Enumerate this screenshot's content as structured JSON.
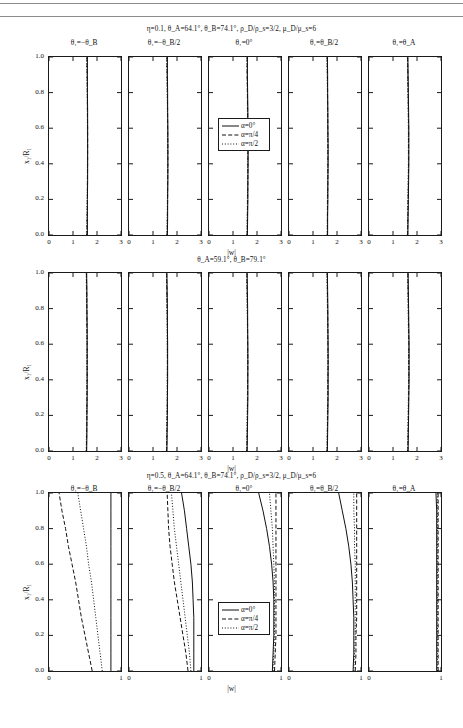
{
  "figure": {
    "xlabel": "|w|",
    "ylabel": "x₁/R₁",
    "legend": {
      "items": [
        {
          "label": "α=0°",
          "style": "solid"
        },
        {
          "label": "α=π/4",
          "style": "dashed"
        },
        {
          "label": "α=π/2",
          "style": "dotted"
        }
      ]
    },
    "column_headers": [
      "θ₁=−θ_B",
      "θ₁=−θ_B/2",
      "θ₁=0°",
      "θ₁=θ_B/2",
      "θ₁=θ_A"
    ],
    "blocks": [
      {
        "title": "η=0.1, θ_A=64.1°, θ_B=74.1°, ρ_D/ρ_s=3/2, μ_D/μ_s=6",
        "xlim": [
          0,
          3
        ],
        "xticks": [
          "0",
          "1",
          "2",
          "3"
        ],
        "ylim": [
          0,
          1
        ],
        "yticks": [
          "0.0",
          "0.2",
          "0.4",
          "0.6",
          "0.8",
          "1.0"
        ],
        "has_legend": true
      },
      {
        "title": "θ_A=59.1°,  θ_B=79.1°",
        "xlim": [
          0,
          3
        ],
        "xticks": [
          "0",
          "1",
          "2",
          "3"
        ],
        "ylim": [
          0,
          1
        ],
        "yticks": [
          "0.0",
          "0.2",
          "0.4",
          "0.6",
          "0.8",
          "1.0"
        ],
        "has_legend": false
      },
      {
        "title": "η=0.5, θ_A=64.1°, θ_B=74.1°, ρ_D/ρ_s=3/2, μ_D/μ_s=6",
        "xlim": [
          0,
          1
        ],
        "xticks": [
          "0",
          "1"
        ],
        "ylim": [
          0,
          1
        ],
        "yticks": [
          "0.0",
          "0.2",
          "0.4",
          "0.6",
          "0.8",
          "1.0"
        ],
        "has_legend": true
      }
    ]
  },
  "chart_data": {
    "type": "line",
    "xlabel": "|w|",
    "ylabel": "x₁/R₁",
    "y": [
      0.0,
      0.1,
      0.2,
      0.3,
      0.4,
      0.5,
      0.6,
      0.7,
      0.8,
      0.9,
      1.0
    ],
    "grid": false,
    "legend_position": "center-panel-middle",
    "panels": [
      {
        "block": 0,
        "block_title": "η=0.1, θ_A=64.1°, θ_B=74.1°, ρ_D/ρ_s=3/2, μ_D/μ_s=6",
        "column": "θ₁=−θ_B",
        "xlim": [
          0,
          3
        ],
        "series": [
          {
            "name": "α=0°",
            "style": "solid",
            "values": [
              1.6,
              1.6,
              1.6,
              1.61,
              1.61,
              1.61,
              1.61,
              1.61,
              1.6,
              1.6,
              1.6
            ]
          },
          {
            "name": "α=π/4",
            "style": "dashed",
            "values": [
              1.58,
              1.59,
              1.6,
              1.6,
              1.61,
              1.61,
              1.61,
              1.6,
              1.6,
              1.59,
              1.58
            ]
          },
          {
            "name": "α=π/2",
            "style": "dotted",
            "values": [
              1.57,
              1.58,
              1.59,
              1.6,
              1.6,
              1.61,
              1.6,
              1.6,
              1.59,
              1.58,
              1.57
            ]
          }
        ]
      },
      {
        "block": 0,
        "column": "θ₁=−θ_B/2",
        "xlim": [
          0,
          3
        ],
        "series": [
          {
            "name": "α=0°",
            "style": "solid",
            "values": [
              1.6,
              1.61,
              1.61,
              1.62,
              1.62,
              1.62,
              1.62,
              1.61,
              1.61,
              1.6,
              1.6
            ]
          },
          {
            "name": "α=π/4",
            "style": "dashed",
            "values": [
              1.59,
              1.6,
              1.61,
              1.61,
              1.62,
              1.62,
              1.61,
              1.61,
              1.6,
              1.59,
              1.58
            ]
          },
          {
            "name": "α=π/2",
            "style": "dotted",
            "values": [
              1.58,
              1.59,
              1.6,
              1.61,
              1.61,
              1.61,
              1.61,
              1.6,
              1.59,
              1.58,
              1.57
            ]
          }
        ]
      },
      {
        "block": 0,
        "column": "θ₁=0°",
        "xlim": [
          0,
          3
        ],
        "series": [
          {
            "name": "α=0°",
            "style": "solid",
            "values": [
              1.6,
              1.61,
              1.62,
              1.62,
              1.63,
              1.63,
              1.62,
              1.62,
              1.61,
              1.6,
              1.6
            ]
          },
          {
            "name": "α=π/4",
            "style": "dashed",
            "values": [
              1.59,
              1.6,
              1.61,
              1.62,
              1.62,
              1.62,
              1.62,
              1.61,
              1.6,
              1.59,
              1.59
            ]
          },
          {
            "name": "α=π/2",
            "style": "dotted",
            "values": [
              1.58,
              1.59,
              1.6,
              1.61,
              1.61,
              1.62,
              1.61,
              1.6,
              1.6,
              1.59,
              1.58
            ]
          }
        ]
      },
      {
        "block": 0,
        "column": "θ₁=θ_B/2",
        "xlim": [
          0,
          3
        ],
        "series": [
          {
            "name": "α=0°",
            "style": "solid",
            "values": [
              1.61,
              1.61,
              1.62,
              1.62,
              1.63,
              1.63,
              1.62,
              1.62,
              1.61,
              1.61,
              1.6
            ]
          },
          {
            "name": "α=π/4",
            "style": "dashed",
            "values": [
              1.6,
              1.6,
              1.61,
              1.62,
              1.62,
              1.62,
              1.62,
              1.61,
              1.61,
              1.6,
              1.59
            ]
          },
          {
            "name": "α=π/2",
            "style": "dotted",
            "values": [
              1.59,
              1.6,
              1.6,
              1.61,
              1.62,
              1.62,
              1.61,
              1.61,
              1.6,
              1.59,
              1.58
            ]
          }
        ]
      },
      {
        "block": 0,
        "column": "θ₁=θ_A",
        "xlim": [
          0,
          3
        ],
        "series": [
          {
            "name": "α=0°",
            "style": "solid",
            "values": [
              1.62,
              1.63,
              1.64,
              1.65,
              1.66,
              1.66,
              1.66,
              1.65,
              1.64,
              1.63,
              1.62
            ]
          },
          {
            "name": "α=π/4",
            "style": "dashed",
            "values": [
              1.61,
              1.62,
              1.63,
              1.64,
              1.65,
              1.65,
              1.65,
              1.64,
              1.63,
              1.62,
              1.61
            ]
          },
          {
            "name": "α=π/2",
            "style": "dotted",
            "values": [
              1.6,
              1.61,
              1.62,
              1.63,
              1.64,
              1.64,
              1.64,
              1.63,
              1.62,
              1.61,
              1.6
            ]
          }
        ]
      },
      {
        "block": 1,
        "block_title": "θ_A=59.1°,  θ_B=79.1°",
        "column": "θ₁=−θ_B",
        "xlim": [
          0,
          3
        ],
        "series": [
          {
            "name": "α=0°",
            "style": "solid",
            "values": [
              1.57,
              1.58,
              1.58,
              1.59,
              1.59,
              1.59,
              1.59,
              1.59,
              1.58,
              1.58,
              1.57
            ]
          },
          {
            "name": "α=π/4",
            "style": "dashed",
            "values": [
              1.56,
              1.57,
              1.58,
              1.58,
              1.59,
              1.59,
              1.59,
              1.58,
              1.58,
              1.57,
              1.56
            ]
          },
          {
            "name": "α=π/2",
            "style": "dotted",
            "values": [
              1.55,
              1.56,
              1.57,
              1.58,
              1.58,
              1.58,
              1.58,
              1.58,
              1.57,
              1.56,
              1.55
            ]
          }
        ]
      },
      {
        "block": 1,
        "column": "θ₁=−θ_B/2",
        "xlim": [
          0,
          3
        ],
        "series": [
          {
            "name": "α=0°",
            "style": "solid",
            "values": [
              1.58,
              1.59,
              1.6,
              1.6,
              1.61,
              1.61,
              1.61,
              1.6,
              1.6,
              1.59,
              1.58
            ]
          },
          {
            "name": "α=π/4",
            "style": "dashed",
            "values": [
              1.57,
              1.58,
              1.59,
              1.6,
              1.6,
              1.6,
              1.6,
              1.6,
              1.59,
              1.58,
              1.57
            ]
          },
          {
            "name": "α=π/2",
            "style": "dotted",
            "values": [
              1.56,
              1.57,
              1.58,
              1.59,
              1.59,
              1.6,
              1.59,
              1.59,
              1.58,
              1.57,
              1.56
            ]
          }
        ]
      },
      {
        "block": 1,
        "column": "θ₁=0°",
        "xlim": [
          0,
          3
        ],
        "series": [
          {
            "name": "α=0°",
            "style": "solid",
            "values": [
              1.59,
              1.6,
              1.61,
              1.62,
              1.62,
              1.62,
              1.62,
              1.61,
              1.61,
              1.6,
              1.59
            ]
          },
          {
            "name": "α=π/4",
            "style": "dashed",
            "values": [
              1.58,
              1.59,
              1.6,
              1.61,
              1.61,
              1.62,
              1.61,
              1.61,
              1.6,
              1.59,
              1.58
            ]
          },
          {
            "name": "α=π/2",
            "style": "dotted",
            "values": [
              1.57,
              1.58,
              1.59,
              1.6,
              1.61,
              1.61,
              1.61,
              1.6,
              1.59,
              1.58,
              1.57
            ]
          }
        ]
      },
      {
        "block": 1,
        "column": "θ₁=θ_B/2",
        "xlim": [
          0,
          3
        ],
        "series": [
          {
            "name": "α=0°",
            "style": "solid",
            "values": [
              1.6,
              1.61,
              1.62,
              1.63,
              1.63,
              1.63,
              1.63,
              1.62,
              1.62,
              1.61,
              1.6
            ]
          },
          {
            "name": "α=π/4",
            "style": "dashed",
            "values": [
              1.59,
              1.6,
              1.61,
              1.62,
              1.62,
              1.63,
              1.62,
              1.62,
              1.61,
              1.6,
              1.59
            ]
          },
          {
            "name": "α=π/2",
            "style": "dotted",
            "values": [
              1.58,
              1.59,
              1.6,
              1.61,
              1.62,
              1.62,
              1.62,
              1.61,
              1.6,
              1.59,
              1.58
            ]
          }
        ]
      },
      {
        "block": 1,
        "column": "θ₁=θ_A",
        "xlim": [
          0,
          3
        ],
        "series": [
          {
            "name": "α=0°",
            "style": "solid",
            "values": [
              1.63,
              1.64,
              1.65,
              1.66,
              1.67,
              1.67,
              1.67,
              1.66,
              1.65,
              1.64,
              1.63
            ]
          },
          {
            "name": "α=π/4",
            "style": "dashed",
            "values": [
              1.62,
              1.63,
              1.64,
              1.65,
              1.66,
              1.66,
              1.66,
              1.65,
              1.64,
              1.63,
              1.62
            ]
          },
          {
            "name": "α=π/2",
            "style": "dotted",
            "values": [
              1.61,
              1.62,
              1.63,
              1.64,
              1.65,
              1.65,
              1.65,
              1.64,
              1.63,
              1.62,
              1.61
            ]
          }
        ]
      },
      {
        "block": 2,
        "block_title": "η=0.5, θ_A=64.1°, θ_B=74.1°, ρ_D/ρ_s=3/2, μ_D/μ_s=6",
        "column": "θ₁=−θ_B",
        "xlim": [
          0,
          1
        ],
        "series": [
          {
            "name": "α=0°",
            "style": "solid",
            "values": [
              0.86,
              0.86,
              0.86,
              0.86,
              0.86,
              0.86,
              0.86,
              0.86,
              0.86,
              0.86,
              0.86
            ]
          },
          {
            "name": "α=π/4",
            "style": "dashed",
            "values": [
              0.6,
              0.55,
              0.5,
              0.45,
              0.41,
              0.37,
              0.32,
              0.27,
              0.23,
              0.18,
              0.14
            ]
          },
          {
            "name": "α=π/2",
            "style": "dotted",
            "values": [
              0.74,
              0.71,
              0.68,
              0.65,
              0.62,
              0.59,
              0.55,
              0.52,
              0.48,
              0.44,
              0.4
            ]
          }
        ]
      },
      {
        "block": 2,
        "column": "θ₁=−θ_B/2",
        "xlim": [
          0,
          1
        ],
        "series": [
          {
            "name": "α=0°",
            "style": "solid",
            "values": [
              0.9,
              0.9,
              0.9,
              0.9,
              0.89,
              0.88,
              0.86,
              0.83,
              0.8,
              0.77,
              0.73
            ]
          },
          {
            "name": "α=π/4",
            "style": "dashed",
            "values": [
              0.82,
              0.79,
              0.75,
              0.71,
              0.67,
              0.63,
              0.6,
              0.57,
              0.55,
              0.54,
              0.53
            ]
          },
          {
            "name": "α=π/2",
            "style": "dotted",
            "values": [
              0.86,
              0.84,
              0.81,
              0.78,
              0.75,
              0.72,
              0.69,
              0.66,
              0.63,
              0.61,
              0.59
            ]
          }
        ]
      },
      {
        "block": 2,
        "column": "θ₁=0°",
        "xlim": [
          0,
          1
        ],
        "series": [
          {
            "name": "α=0°",
            "style": "solid",
            "values": [
              0.88,
              0.89,
              0.9,
              0.9,
              0.9,
              0.89,
              0.87,
              0.84,
              0.8,
              0.75,
              0.69
            ]
          },
          {
            "name": "α=π/4",
            "style": "dashed",
            "values": [
              0.91,
              0.92,
              0.93,
              0.93,
              0.93,
              0.93,
              0.93,
              0.93,
              0.93,
              0.93,
              0.93
            ]
          },
          {
            "name": "α=π/2",
            "style": "dotted",
            "values": [
              0.89,
              0.9,
              0.91,
              0.91,
              0.91,
              0.91,
              0.9,
              0.89,
              0.88,
              0.86,
              0.84
            ]
          }
        ]
      },
      {
        "block": 2,
        "column": "θ₁=θ_B/2",
        "xlim": [
          0,
          1
        ],
        "series": [
          {
            "name": "α=0°",
            "style": "solid",
            "values": [
              0.89,
              0.9,
              0.9,
              0.9,
              0.89,
              0.88,
              0.86,
              0.83,
              0.79,
              0.74,
              0.69
            ]
          },
          {
            "name": "α=π/4",
            "style": "dashed",
            "values": [
              0.92,
              0.93,
              0.93,
              0.94,
              0.94,
              0.94,
              0.94,
              0.94,
              0.94,
              0.94,
              0.94
            ]
          },
          {
            "name": "α=π/2",
            "style": "dotted",
            "values": [
              0.9,
              0.91,
              0.92,
              0.92,
              0.92,
              0.92,
              0.92,
              0.91,
              0.91,
              0.9,
              0.9
            ]
          }
        ]
      },
      {
        "block": 2,
        "column": "θ₁=θ_A",
        "xlim": [
          0,
          1
        ],
        "series": [
          {
            "name": "α=0°",
            "style": "solid",
            "values": [
              0.94,
              0.94,
              0.94,
              0.94,
              0.94,
              0.94,
              0.94,
              0.94,
              0.94,
              0.94,
              0.93
            ]
          },
          {
            "name": "α=π/4",
            "style": "dashed",
            "values": [
              0.96,
              0.96,
              0.96,
              0.96,
              0.96,
              0.96,
              0.96,
              0.96,
              0.96,
              0.96,
              0.96
            ]
          },
          {
            "name": "α=π/2",
            "style": "dotted",
            "values": [
              0.95,
              0.95,
              0.95,
              0.95,
              0.95,
              0.95,
              0.95,
              0.95,
              0.95,
              0.95,
              0.95
            ]
          }
        ]
      }
    ]
  }
}
